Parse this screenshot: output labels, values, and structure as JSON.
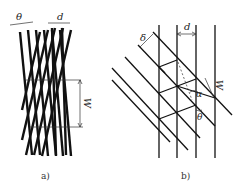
{
  "panels": {
    "a": {
      "caption": "a)",
      "labels": {
        "theta": "θ",
        "d": "d",
        "w": "W"
      }
    },
    "b": {
      "caption": "b)",
      "labels": {
        "delta": "δ",
        "d": "d",
        "w": "W",
        "alpha": "α",
        "theta": "θ"
      }
    }
  },
  "colors": {
    "line": "#111111",
    "background": "#ffffff"
  }
}
